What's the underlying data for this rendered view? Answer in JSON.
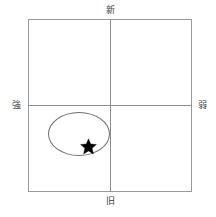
{
  "diagram": {
    "type": "2x2-positioning-matrix",
    "axes": {
      "vertical": {
        "top_label": "新",
        "bottom_label": "旧"
      },
      "horizontal": {
        "left_label": "強",
        "right_label": "弱"
      }
    },
    "markers": {
      "star": {
        "name": "star-marker",
        "quadrant": "lower-left",
        "color": "#000000"
      },
      "ellipse": {
        "name": "grouping-ellipse",
        "quadrant": "lower-left",
        "color": "#6f6f6f"
      }
    },
    "colors": {
      "frame": "#9a9a9a",
      "axis": "#8d8d8d",
      "ellipse": "#6f6f6f",
      "star": "#000000",
      "label_text": "#3a3a3a",
      "background": "#ffffff"
    }
  }
}
